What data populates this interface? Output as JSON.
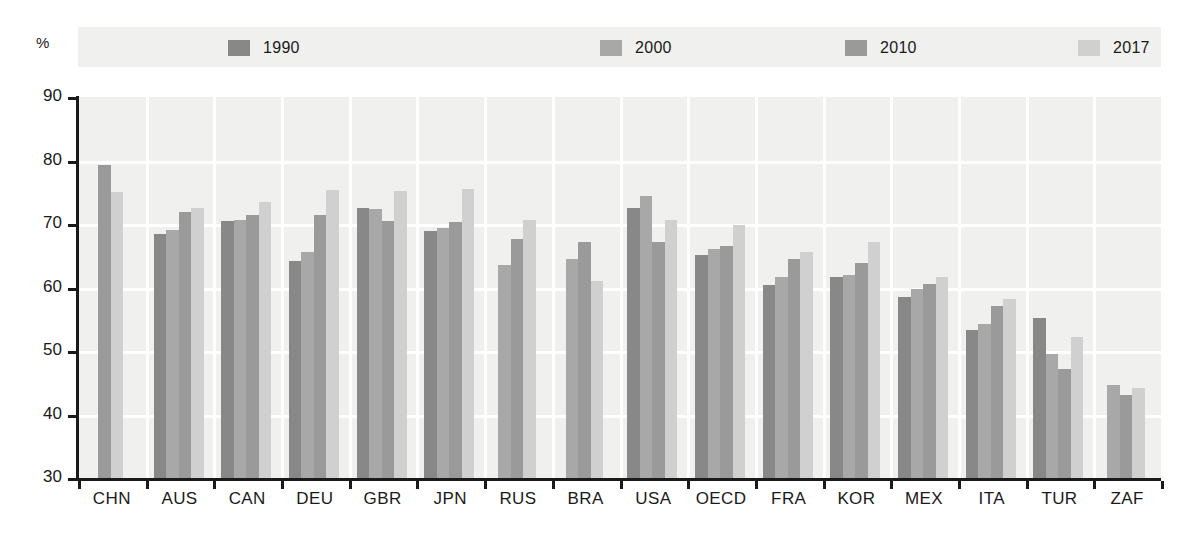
{
  "axis": {
    "unit_label": "%",
    "y_ticks": [
      90,
      80,
      70,
      60,
      50,
      40,
      30
    ],
    "y_min": 30,
    "y_max": 90
  },
  "legend": {
    "items": [
      {
        "label": "1990",
        "color": "#888888"
      },
      {
        "label": "2000",
        "color": "#a8a8a8"
      },
      {
        "label": "2010",
        "color": "#9a9a9a"
      },
      {
        "label": "2017",
        "color": "#d0d0d0"
      }
    ]
  },
  "chart_data": {
    "type": "bar",
    "title": "",
    "xlabel": "",
    "ylabel": "%",
    "ylim": [
      30,
      90
    ],
    "grid": true,
    "legend_position": "top",
    "categories": [
      "CHN",
      "AUS",
      "CAN",
      "DEU",
      "GBR",
      "JPN",
      "RUS",
      "BRA",
      "USA",
      "OECD",
      "FRA",
      "KOR",
      "MEX",
      "ITA",
      "TUR",
      "ZAF"
    ],
    "series": [
      {
        "name": "1990",
        "color": "#888888",
        "values": [
          null,
          68.4,
          70.4,
          64.2,
          72.6,
          68.9,
          null,
          null,
          72.6,
          65.1,
          60.4,
          61.7,
          58.5,
          53.3,
          55.2,
          null
        ]
      },
      {
        "name": "2000",
        "color": "#a8a8a8",
        "values": [
          null,
          69.1,
          70.6,
          65.6,
          72.4,
          69.4,
          63.5,
          64.5,
          74.4,
          66.1,
          61.7,
          62.0,
          59.8,
          54.2,
          49.5,
          44.6
        ]
      },
      {
        "name": "2010",
        "color": "#9a9a9a",
        "values": [
          79.3,
          71.9,
          71.4,
          71.4,
          70.5,
          70.3,
          67.6,
          67.2,
          67.2,
          66.6,
          64.5,
          63.8,
          60.5,
          57.1,
          47.1,
          43.0
        ]
      },
      {
        "name": "2017",
        "color": "#d0d0d0",
        "values": [
          75.0,
          72.6,
          73.5,
          75.4,
          75.2,
          75.5,
          70.6,
          61.1,
          70.6,
          69.8,
          65.6,
          67.1,
          61.6,
          58.2,
          52.2,
          44.1
        ]
      }
    ]
  }
}
